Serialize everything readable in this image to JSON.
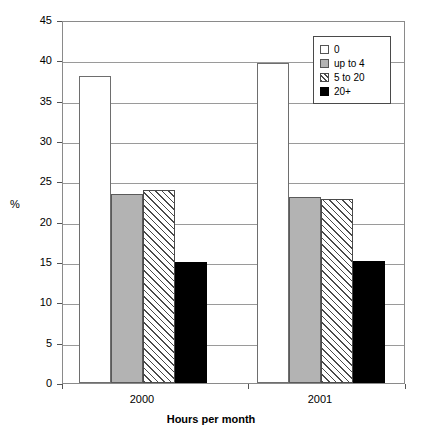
{
  "chart_data": {
    "type": "bar",
    "title": "",
    "xlabel": "Hours per month",
    "ylabel": "%",
    "categories": [
      "2000",
      "2001"
    ],
    "series": [
      {
        "name": "0",
        "values": [
          38.0,
          39.7
        ],
        "fill": "white"
      },
      {
        "name": "up to 4",
        "values": [
          23.4,
          23.0
        ],
        "fill": "gray"
      },
      {
        "name": "5 to 20",
        "values": [
          23.9,
          22.8
        ],
        "fill": "hatch"
      },
      {
        "name": "20+",
        "values": [
          15.0,
          15.1
        ],
        "fill": "black"
      }
    ],
    "ylim": [
      0,
      45
    ],
    "ytick_step": 5,
    "yticks": [
      "0",
      "5",
      "10",
      "15",
      "20",
      "25",
      "30",
      "35",
      "40",
      "45"
    ],
    "grid": true,
    "grid_axis": "y",
    "legend_position": "top-right",
    "legend_border": true,
    "colors": {
      "series_0": "#ffffff",
      "series_1": "#b3b3b3",
      "series_2": "#ffffff",
      "series_3": "#000000",
      "grid": "#9a9a9a",
      "axis": "#8a8a8a",
      "text": "#000000"
    }
  }
}
